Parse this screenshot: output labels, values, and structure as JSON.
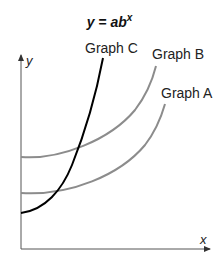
{
  "title": {
    "base": "y = ab",
    "exponent": "x"
  },
  "axes": {
    "x_label": "x",
    "y_label": "y"
  },
  "curves": [
    {
      "name": "Graph A",
      "color": "#8c8c8c"
    },
    {
      "name": "Graph B",
      "color": "#8c8c8c"
    },
    {
      "name": "Graph C",
      "color": "#000000"
    }
  ],
  "labels": {
    "graph_a": "Graph A",
    "graph_b": "Graph B",
    "graph_c": "Graph C"
  }
}
